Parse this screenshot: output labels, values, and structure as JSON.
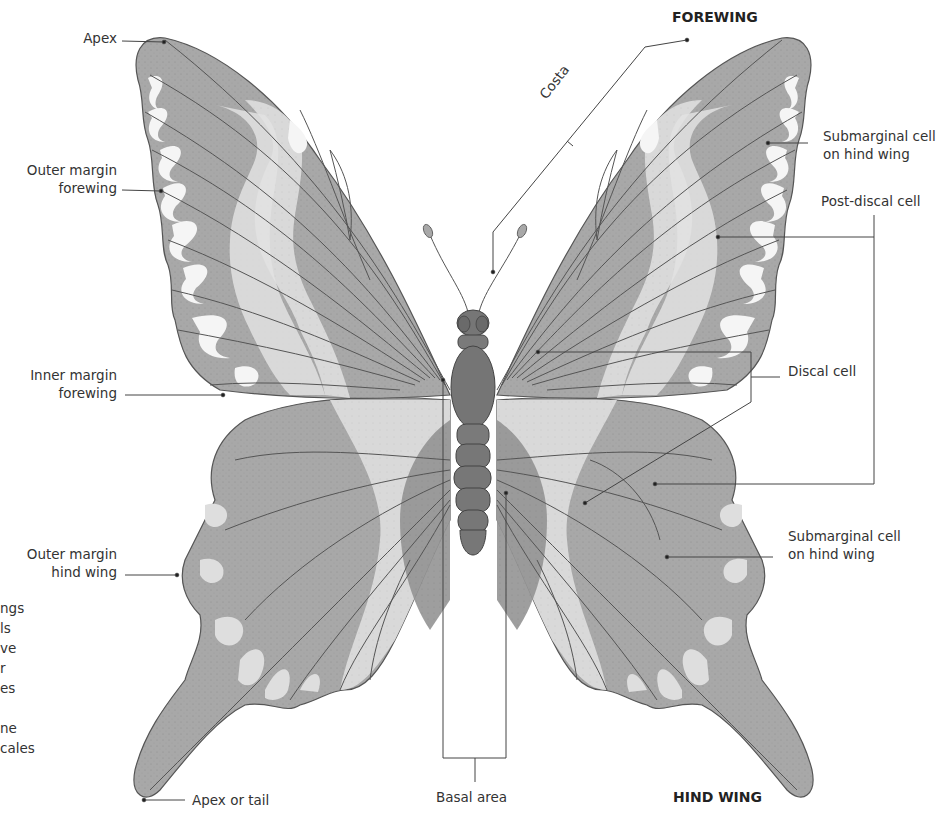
{
  "diagram": {
    "colors": {
      "wing_fill": "#a9a9a9",
      "wing_dark": "#8f8f8f",
      "band_light": "#dcdcdc",
      "spot_white": "#f4f4f4",
      "body": "#7c7c7c",
      "vein": "#555555",
      "leader": "#444444",
      "background": "#ffffff"
    },
    "headings": {
      "forewing": "FOREWING",
      "hind_wing": "HIND WING"
    },
    "labels": {
      "apex": "Apex",
      "outer_margin_forewing_1": "Outer margin",
      "outer_margin_forewing_2": "forewing",
      "inner_margin_forewing_1": "Inner margin",
      "inner_margin_forewing_2": "forewing",
      "outer_margin_hind_wing_1": "Outer margin",
      "outer_margin_hind_wing_2": "hind wing",
      "apex_or_tail": "Apex or tail",
      "basal_area": "Basal area",
      "costa": "Costa",
      "submarginal_top_1": "Submarginal cell",
      "submarginal_top_2": "on hind wing",
      "post_discal": "Post-discal cell",
      "discal": "Discal cell",
      "submarginal_bottom_1": "Submarginal cell",
      "submarginal_bottom_2": "on hind wing"
    },
    "cropped_side_text": [
      "ngs",
      "ls",
      "ve",
      "r",
      "es",
      "",
      "ne",
      "cales"
    ]
  }
}
